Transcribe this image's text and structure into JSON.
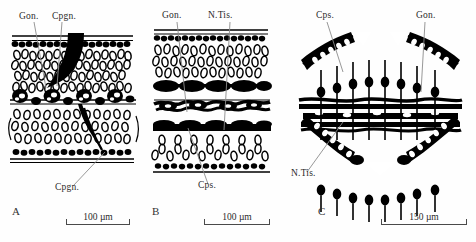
{
  "figure": {
    "type": "histological-line-drawing",
    "panels": [
      {
        "letter": "A",
        "labels": [
          {
            "name": "gonad",
            "text": "Gon."
          },
          {
            "name": "coupling-canal",
            "text": "Cpgn."
          },
          {
            "name": "coupling-canal-lower",
            "text": "Cpgn."
          }
        ],
        "scale": {
          "text": "100 µm",
          "value": 100,
          "unit": "µm"
        }
      },
      {
        "letter": "B",
        "labels": [
          {
            "name": "gonad",
            "text": "Gon."
          },
          {
            "name": "nervous-tissue",
            "text": "N.Tis."
          },
          {
            "name": "capsule",
            "text": "Cps."
          }
        ],
        "scale": {
          "text": "100 µm",
          "value": 100,
          "unit": "µm"
        }
      },
      {
        "letter": "C",
        "labels": [
          {
            "name": "capsule",
            "text": "Cps."
          },
          {
            "name": "gonad",
            "text": "Gon."
          },
          {
            "name": "nervous-tissue",
            "text": "N.Tis."
          }
        ],
        "scale": {
          "text": "150 µm",
          "value": 150,
          "unit": "µm"
        }
      }
    ],
    "colors": {
      "ink": "#000000",
      "leader": "#8c8c8c",
      "text": "#2a2a2a",
      "background": "#ffffff"
    }
  }
}
